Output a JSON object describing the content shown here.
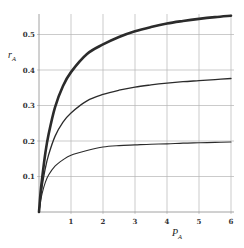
{
  "chart_data": {
    "type": "line",
    "title": "",
    "xlabel": "P_A",
    "ylabel": "r_A",
    "xlim": [
      0,
      6
    ],
    "ylim": [
      0,
      0.55
    ],
    "grid": true,
    "legend": null,
    "x_ticks": [
      "1",
      "2",
      "3",
      "4",
      "5",
      "6"
    ],
    "y_ticks": [
      "0.1",
      "0.2",
      "0.3",
      "0.4",
      "0.5"
    ],
    "x": [
      0,
      0.05,
      0.1,
      0.2,
      0.3,
      0.5,
      0.75,
      1,
      1.5,
      2,
      2.5,
      3,
      3.5,
      4,
      4.5,
      5,
      5.5,
      6
    ],
    "series": [
      {
        "name": "curve-1 (thick)",
        "values": [
          0,
          0.056,
          0.097,
          0.167,
          0.219,
          0.295,
          0.355,
          0.394,
          0.445,
          0.472,
          0.493,
          0.509,
          0.521,
          0.531,
          0.538,
          0.544,
          0.549,
          0.553
        ],
        "width": 2.6
      },
      {
        "name": "curve-2",
        "values": [
          0,
          0.04,
          0.073,
          0.124,
          0.161,
          0.213,
          0.253,
          0.279,
          0.313,
          0.331,
          0.343,
          0.352,
          0.358,
          0.363,
          0.367,
          0.37,
          0.373,
          0.376
        ],
        "width": 1.3
      },
      {
        "name": "curve-3",
        "values": [
          0,
          0.03,
          0.053,
          0.084,
          0.104,
          0.129,
          0.147,
          0.16,
          0.173,
          0.183,
          0.187,
          0.189,
          0.191,
          0.192,
          0.194,
          0.195,
          0.196,
          0.197
        ],
        "width": 1.1
      }
    ]
  },
  "labels": {
    "y_main": "r",
    "y_sub": "A",
    "x_main": "P",
    "x_sub": "A"
  },
  "style": {
    "line_color": "#2b2b2b",
    "grid_color": "#b5b5b5",
    "axis_color": "#8a8a8a"
  }
}
